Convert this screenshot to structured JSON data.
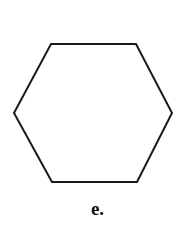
{
  "figure": {
    "caption": "e.",
    "shape_name": "hexagon",
    "shape_label": "regular hexagon outline",
    "stroke_color": "#1a1a1a",
    "fill_color": "#ffffff",
    "stroke_width": 2,
    "background_color": "#ffffff",
    "vertices": [
      {
        "x": 51,
        "y": 44
      },
      {
        "x": 136,
        "y": 44
      },
      {
        "x": 172,
        "y": 113
      },
      {
        "x": 137,
        "y": 182
      },
      {
        "x": 52,
        "y": 182
      },
      {
        "x": 14,
        "y": 113
      }
    ],
    "points_attr": "51,44 136,44 172,113 137,182 52,182 14,113"
  }
}
